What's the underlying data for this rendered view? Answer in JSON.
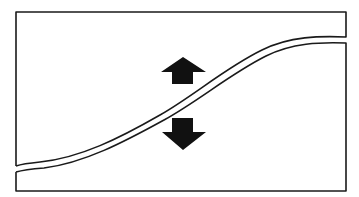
{
  "diagram": {
    "colors": {
      "background": "#ffffff",
      "stroke": "#1a1a1a",
      "arrow_fill": "#111111"
    },
    "elements": {
      "upper_region": "upper-region",
      "lower_region": "lower-region",
      "curve": "s-curve-divider",
      "arrows": [
        {
          "direction": "up",
          "icon": "arrow-up-icon"
        },
        {
          "direction": "down",
          "icon": "arrow-down-icon"
        }
      ]
    }
  }
}
